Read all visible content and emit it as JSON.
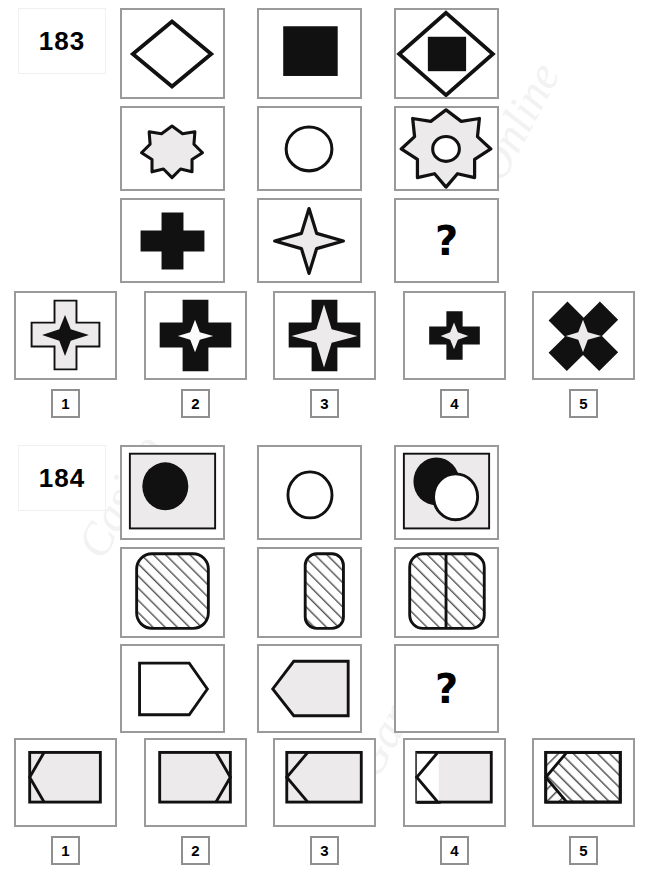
{
  "page": {
    "background": "#ffffff",
    "gray_fill": "#eceaea",
    "black": "#111111",
    "frame_gray": "#9a9a9a",
    "watermarks": [
      "Online",
      "Casino",
      "Games"
    ]
  },
  "puzzles": [
    {
      "id": "183",
      "number_label": "183",
      "question_mark": "?",
      "matrix": {
        "rows": 3,
        "cols": 3,
        "cells": [
          {
            "name": "cell-r1c1",
            "desc": "diamond-outline"
          },
          {
            "name": "cell-r1c2",
            "desc": "black-square"
          },
          {
            "name": "cell-r1c3",
            "desc": "diamond-outline-with-black-square"
          },
          {
            "name": "cell-r2c1",
            "desc": "small-seven-point-star"
          },
          {
            "name": "cell-r2c2",
            "desc": "circle-outline"
          },
          {
            "name": "cell-r2c3",
            "desc": "large-seven-point-star-with-circle-hole"
          },
          {
            "name": "cell-r3c1",
            "desc": "black-cross"
          },
          {
            "name": "cell-r3c2",
            "desc": "four-point-star-outline"
          },
          {
            "name": "cell-r3c3",
            "desc": "question-mark"
          }
        ]
      },
      "options": [
        {
          "number": "1",
          "desc": "outlined-cross-with-black-four-point-star"
        },
        {
          "number": "2",
          "desc": "black-cross-with-white-four-point-star"
        },
        {
          "number": "3",
          "desc": "black-cross-with-large-white-four-point-star"
        },
        {
          "number": "4",
          "desc": "small-black-cross-with-white-four-point-star"
        },
        {
          "number": "5",
          "desc": "rotated-black-cross-with-white-four-point-star"
        }
      ]
    },
    {
      "id": "184",
      "number_label": "184",
      "question_mark": "?",
      "matrix": {
        "rows": 3,
        "cols": 3,
        "cells": [
          {
            "name": "cell-r1c1",
            "desc": "gray-square-with-black-circle"
          },
          {
            "name": "cell-r1c2",
            "desc": "circle-outline"
          },
          {
            "name": "cell-r1c3",
            "desc": "gray-square-with-black-circle-and-white-circle"
          },
          {
            "name": "cell-r2c1",
            "desc": "large-hatched-rounded-square"
          },
          {
            "name": "cell-r2c2",
            "desc": "narrow-hatched-rounded-rect"
          },
          {
            "name": "cell-r2c3",
            "desc": "hatched-rounded-rect-split-two-halves"
          },
          {
            "name": "cell-r3c1",
            "desc": "right-pointing-pentagon-outline"
          },
          {
            "name": "cell-r3c2",
            "desc": "left-pointing-pentagon-gray"
          },
          {
            "name": "cell-r3c3",
            "desc": "question-mark"
          }
        ]
      },
      "options": [
        {
          "number": "1",
          "desc": "rect-with-left-notch-pentagon-inside"
        },
        {
          "number": "2",
          "desc": "rect-with-right-point-pentagon-inside"
        },
        {
          "number": "3",
          "desc": "rect-with-left-notch-pentagon-wide"
        },
        {
          "number": "4",
          "desc": "rect-with-left-notch-open-pentagon"
        },
        {
          "number": "5",
          "desc": "hatched-rect-with-left-notch"
        }
      ]
    }
  ]
}
